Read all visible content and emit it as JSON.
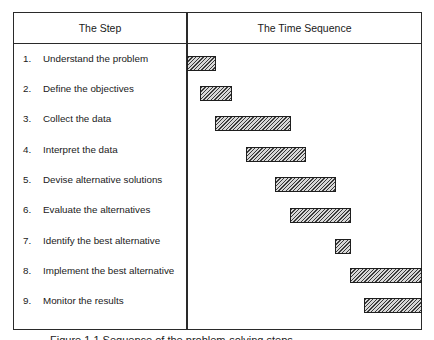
{
  "table": {
    "headers": {
      "step": "The Step",
      "time": "The Time Sequence"
    },
    "rows": [
      {
        "num": "1.",
        "label": "Understand the problem"
      },
      {
        "num": "2.",
        "label": "Define the objectives"
      },
      {
        "num": "3.",
        "label": "Collect the data"
      },
      {
        "num": "4.",
        "label": "Interpret the data"
      },
      {
        "num": "5.",
        "label": "Devise alternative solutions"
      },
      {
        "num": "6.",
        "label": "Evaluate the alternatives"
      },
      {
        "num": "7.",
        "label": "Identify the best alternative"
      },
      {
        "num": "8.",
        "label": "Implement the best alternative"
      },
      {
        "num": "9.",
        "label": "Monitor the results"
      }
    ]
  },
  "bars": [
    {
      "step": 1,
      "start_px": 187,
      "end_px": 215
    },
    {
      "step": 2,
      "start_px": 200,
      "end_px": 232
    },
    {
      "step": 3,
      "start_px": 215,
      "end_px": 290
    },
    {
      "step": 4,
      "start_px": 246,
      "end_px": 305
    },
    {
      "step": 5,
      "start_px": 275,
      "end_px": 335
    },
    {
      "step": 6,
      "start_px": 290,
      "end_px": 350
    },
    {
      "step": 7,
      "start_px": 335,
      "end_px": 351
    },
    {
      "step": 8,
      "start_px": 350,
      "end_px": 423
    },
    {
      "step": 9,
      "start_px": 364,
      "end_px": 423
    }
  ],
  "caption": "Figure 1.1   Sequence of the problem-solving steps",
  "colors": {
    "line": "#2a2a2a",
    "hatch_dark": "#3a3a3a",
    "hatch_light": "#d8d8d8"
  }
}
